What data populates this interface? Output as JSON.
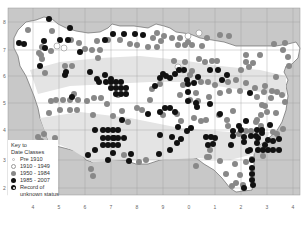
{
  "legend": {
    "title": "Key to",
    "subtitle": "Date Classes",
    "items": [
      {
        "label": "Pre 1910",
        "class": "pre"
      },
      {
        "label": "1910 - 1949",
        "class": "c1910"
      },
      {
        "label": "1950 - 1984",
        "class": "c1950"
      },
      {
        "label": "1985 - 2007",
        "class": "c1985"
      },
      {
        "label": "Record of",
        "class": "unk"
      }
    ],
    "continuation": "unknown status"
  },
  "axes": {
    "x_ticks": [
      {
        "label": "4",
        "x": 33
      },
      {
        "label": "5",
        "x": 59
      },
      {
        "label": "6",
        "x": 85
      },
      {
        "label": "7",
        "x": 111
      },
      {
        "label": "8",
        "x": 137
      },
      {
        "label": "9",
        "x": 163
      },
      {
        "label": "0",
        "x": 189
      },
      {
        "label": "1",
        "x": 215
      },
      {
        "label": "2",
        "x": 241
      },
      {
        "label": "3",
        "x": 267
      },
      {
        "label": "4",
        "x": 293
      }
    ],
    "y_ticks": [
      {
        "label": "8",
        "y": 22
      },
      {
        "label": "7",
        "y": 50
      },
      {
        "label": "6",
        "y": 76
      },
      {
        "label": "5",
        "y": 103
      },
      {
        "label": "4",
        "y": 130
      },
      {
        "label": "3",
        "y": 160
      },
      {
        "label": "2",
        "y": 188
      }
    ]
  },
  "colors": {
    "sea": "#c8c8c8",
    "land": "#ffffff",
    "land_shade": "#e4e4e4",
    "grid": "#a0a0a0",
    "c1950": "#888888",
    "c1985": "#111111"
  },
  "dots": {
    "c1985": [
      [
        49,
        19
      ],
      [
        70,
        28
      ],
      [
        44,
        41
      ],
      [
        24,
        44
      ],
      [
        19,
        43
      ],
      [
        60,
        40
      ],
      [
        68,
        40
      ],
      [
        40,
        66
      ],
      [
        80,
        52
      ],
      [
        105,
        40
      ],
      [
        113,
        34
      ],
      [
        124,
        34
      ],
      [
        135,
        34
      ],
      [
        143,
        35
      ],
      [
        45,
        48
      ],
      [
        65,
        75
      ],
      [
        90,
        72
      ],
      [
        105,
        75
      ],
      [
        111,
        79
      ],
      [
        66,
        72
      ],
      [
        97,
        79
      ],
      [
        72,
        97
      ],
      [
        99,
        82
      ],
      [
        106,
        82
      ],
      [
        111,
        82
      ],
      [
        116,
        82
      ],
      [
        121,
        82
      ],
      [
        111,
        88
      ],
      [
        116,
        88
      ],
      [
        121,
        88
      ],
      [
        126,
        88
      ],
      [
        116,
        94
      ],
      [
        121,
        94
      ],
      [
        126,
        94
      ],
      [
        95,
        130
      ],
      [
        103,
        130
      ],
      [
        108,
        130
      ],
      [
        113,
        130
      ],
      [
        118,
        130
      ],
      [
        122,
        120
      ],
      [
        114,
        138
      ],
      [
        103,
        138
      ],
      [
        108,
        138
      ],
      [
        113,
        138
      ],
      [
        118,
        138
      ],
      [
        103,
        145
      ],
      [
        108,
        145
      ],
      [
        113,
        145
      ],
      [
        118,
        145
      ],
      [
        88,
        155
      ],
      [
        95,
        150
      ],
      [
        108,
        160
      ],
      [
        129,
        161
      ],
      [
        131,
        154
      ],
      [
        124,
        138
      ],
      [
        113,
        153
      ],
      [
        155,
        86
      ],
      [
        160,
        78
      ],
      [
        163,
        74
      ],
      [
        170,
        78
      ],
      [
        175,
        74
      ],
      [
        187,
        80
      ],
      [
        194,
        83
      ],
      [
        148,
        114
      ],
      [
        160,
        112
      ],
      [
        165,
        108
      ],
      [
        170,
        108
      ],
      [
        175,
        112
      ],
      [
        188,
        92
      ],
      [
        170,
        150
      ],
      [
        166,
        76
      ],
      [
        179,
        70
      ],
      [
        184,
        70
      ],
      [
        198,
        77
      ],
      [
        210,
        70
      ],
      [
        218,
        70
      ],
      [
        222,
        80
      ],
      [
        227,
        75
      ],
      [
        188,
        84
      ],
      [
        159,
        154
      ],
      [
        160,
        135
      ],
      [
        172,
        137
      ],
      [
        178,
        127
      ],
      [
        177,
        143
      ],
      [
        181,
        139
      ],
      [
        187,
        131
      ],
      [
        191,
        128
      ],
      [
        206,
        137
      ],
      [
        211,
        137
      ],
      [
        208,
        145
      ],
      [
        213,
        144
      ],
      [
        215,
        138
      ],
      [
        188,
        101
      ],
      [
        196,
        103
      ],
      [
        197,
        107
      ],
      [
        220,
        114
      ],
      [
        210,
        104
      ],
      [
        233,
        131
      ],
      [
        239,
        126
      ],
      [
        241,
        130
      ],
      [
        246,
        121
      ],
      [
        257,
        143
      ],
      [
        265,
        145
      ],
      [
        258,
        138
      ],
      [
        262,
        133
      ],
      [
        268,
        140
      ],
      [
        273,
        141
      ],
      [
        279,
        139
      ],
      [
        250,
        93
      ],
      [
        250,
        150
      ],
      [
        270,
        125
      ],
      [
        258,
        150
      ],
      [
        263,
        150
      ],
      [
        268,
        150
      ],
      [
        273,
        150
      ],
      [
        279,
        150
      ],
      [
        233,
        136
      ],
      [
        244,
        137
      ],
      [
        251,
        136
      ],
      [
        256,
        136
      ],
      [
        231,
        145
      ],
      [
        244,
        188
      ],
      [
        253,
        185
      ],
      [
        252,
        180
      ],
      [
        252,
        174
      ],
      [
        252,
        168
      ],
      [
        252,
        160
      ],
      [
        257,
        130
      ],
      [
        262,
        130
      ],
      [
        244,
        142
      ],
      [
        248,
        151
      ]
    ],
    "c1950": [
      [
        28,
        30
      ],
      [
        42,
        47
      ],
      [
        41,
        55
      ],
      [
        39,
        53
      ],
      [
        52,
        31
      ],
      [
        45,
        73
      ],
      [
        51,
        51
      ],
      [
        42,
        59
      ],
      [
        51,
        101
      ],
      [
        49,
        113
      ],
      [
        41,
        141
      ],
      [
        44,
        134
      ],
      [
        38,
        137
      ],
      [
        71,
        40
      ],
      [
        79,
        43
      ],
      [
        92,
        50
      ],
      [
        100,
        50
      ],
      [
        98,
        58
      ],
      [
        65,
        66
      ],
      [
        72,
        66
      ],
      [
        85,
        49
      ],
      [
        97,
        41
      ],
      [
        108,
        40
      ],
      [
        120,
        40
      ],
      [
        130,
        44
      ],
      [
        74,
        94
      ],
      [
        56,
        100
      ],
      [
        63,
        100
      ],
      [
        70,
        100
      ],
      [
        78,
        100
      ],
      [
        87,
        101
      ],
      [
        94,
        98
      ],
      [
        101,
        98
      ],
      [
        107,
        104
      ],
      [
        93,
        115
      ],
      [
        113,
        116
      ],
      [
        122,
        111
      ],
      [
        137,
        108
      ],
      [
        128,
        122
      ],
      [
        118,
        95
      ],
      [
        60,
        110
      ],
      [
        70,
        110
      ],
      [
        77,
        110
      ],
      [
        55,
        138
      ],
      [
        53,
        156
      ],
      [
        124,
        155
      ],
      [
        142,
        110
      ],
      [
        150,
        100
      ],
      [
        152,
        89
      ],
      [
        160,
        84
      ],
      [
        180,
        95
      ],
      [
        190,
        100
      ],
      [
        198,
        101
      ],
      [
        196,
        93
      ],
      [
        209,
        97
      ],
      [
        233,
        111
      ],
      [
        220,
        93
      ],
      [
        215,
        85
      ],
      [
        208,
        82
      ],
      [
        201,
        82
      ],
      [
        192,
        71
      ],
      [
        185,
        62
      ],
      [
        199,
        59
      ],
      [
        205,
        62
      ],
      [
        212,
        61
      ],
      [
        217,
        61
      ],
      [
        229,
        36
      ],
      [
        220,
        35
      ],
      [
        207,
        38
      ],
      [
        202,
        46
      ],
      [
        192,
        45
      ],
      [
        185,
        45
      ],
      [
        178,
        45
      ],
      [
        148,
        47
      ],
      [
        137,
        45
      ],
      [
        157,
        47
      ],
      [
        153,
        38
      ],
      [
        157,
        33
      ],
      [
        164,
        36
      ],
      [
        172,
        38
      ],
      [
        180,
        38
      ],
      [
        188,
        42
      ],
      [
        161,
        41
      ],
      [
        174,
        61
      ],
      [
        190,
        75
      ],
      [
        183,
        85
      ],
      [
        163,
        115
      ],
      [
        177,
        114
      ],
      [
        181,
        121
      ],
      [
        194,
        118
      ],
      [
        201,
        121
      ],
      [
        206,
        120
      ],
      [
        219,
        115
      ],
      [
        227,
        120
      ],
      [
        228,
        126
      ],
      [
        239,
        134
      ],
      [
        246,
        131
      ],
      [
        251,
        131
      ],
      [
        261,
        126
      ],
      [
        257,
        120
      ],
      [
        261,
        115
      ],
      [
        267,
        112
      ],
      [
        276,
        113
      ],
      [
        271,
        98
      ],
      [
        272,
        91
      ],
      [
        255,
        88
      ],
      [
        257,
        97
      ],
      [
        264,
        92
      ],
      [
        262,
        105
      ],
      [
        265,
        86
      ],
      [
        277,
        92
      ],
      [
        282,
        95
      ],
      [
        289,
        66
      ],
      [
        288,
        57
      ],
      [
        274,
        44
      ],
      [
        260,
        55
      ],
      [
        246,
        55
      ],
      [
        246,
        62
      ],
      [
        241,
        70
      ],
      [
        249,
        67
      ],
      [
        253,
        63
      ],
      [
        236,
        80
      ],
      [
        228,
        82
      ],
      [
        285,
        43
      ],
      [
        283,
        50
      ],
      [
        276,
        77
      ],
      [
        246,
        83
      ],
      [
        240,
        91
      ],
      [
        229,
        91
      ],
      [
        252,
        159
      ],
      [
        246,
        162
      ],
      [
        235,
        164
      ],
      [
        240,
        175
      ],
      [
        196,
        166
      ],
      [
        207,
        157
      ],
      [
        232,
        186
      ],
      [
        236,
        183
      ],
      [
        243,
        185
      ],
      [
        226,
        174
      ],
      [
        220,
        161
      ],
      [
        210,
        150
      ],
      [
        209,
        157
      ],
      [
        146,
        160
      ],
      [
        139,
        162
      ],
      [
        91,
        169
      ],
      [
        93,
        176
      ],
      [
        256,
        122
      ],
      [
        263,
        156
      ],
      [
        277,
        134
      ],
      [
        283,
        129
      ],
      [
        273,
        132
      ],
      [
        285,
        102
      ],
      [
        265,
        106
      ]
    ],
    "c1910": [
      [
        57,
        46
      ],
      [
        64,
        48
      ],
      [
        188,
        36
      ],
      [
        199,
        33
      ],
      [
        178,
        67
      ],
      [
        183,
        70
      ]
    ]
  }
}
